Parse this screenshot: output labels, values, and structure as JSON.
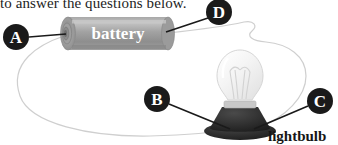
{
  "figure": {
    "heading_clipped": "to answer the questions below.",
    "battery_label": "battery",
    "lightbulb_caption": "lightbulb",
    "markers": [
      {
        "id": "A",
        "letter": "A",
        "cx": 16,
        "cy": 37,
        "r": 13
      },
      {
        "id": "B",
        "letter": "B",
        "cx": 157,
        "cy": 99,
        "r": 13
      },
      {
        "id": "C",
        "letter": "C",
        "cx": 320,
        "cy": 101,
        "r": 13
      },
      {
        "id": "D",
        "letter": "D",
        "cx": 219,
        "cy": 12,
        "r": 13
      }
    ],
    "leader_lines": [
      {
        "id": "A",
        "x1": 29,
        "y1": 37,
        "x2": 64,
        "y2": 34
      },
      {
        "id": "B",
        "x1": 169,
        "y1": 103,
        "x2": 228,
        "y2": 128
      },
      {
        "id": "C",
        "x1": 307,
        "y1": 105,
        "x2": 252,
        "y2": 128
      },
      {
        "id": "D",
        "x1": 207,
        "y1": 18,
        "x2": 166,
        "y2": 33
      }
    ],
    "colors": {
      "marker_fill": "#1a1a1a",
      "marker_text": "#ffffff",
      "wire": "#cfcfcf",
      "battery_body": "#9a9a9a",
      "battery_body_light": "#bdbdbd",
      "battery_cap": "#8d8d8d",
      "bulb_glass": "#f2f2f2",
      "bulb_glass_edge": "#d6d6d6",
      "bulb_base": "#2a2a2a",
      "bulb_collar": "#cccccc",
      "caption_text": "#161616",
      "heading_text": "#1d1d1d",
      "background": "#ffffff"
    }
  }
}
